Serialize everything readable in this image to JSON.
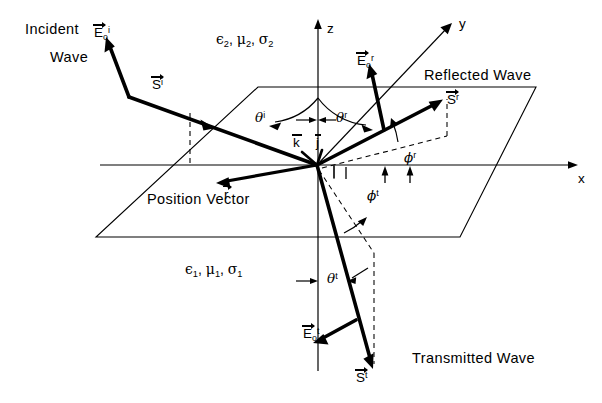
{
  "figure": {
    "background": "#ffffff",
    "stroke": "#000000"
  },
  "labels": {
    "incident_wave_line1": "Incident",
    "incident_wave_line2": "Wave",
    "reflected_wave": "Reflected  Wave",
    "transmitted_wave": "Transmitted  Wave",
    "position_vector": "Position  Vector",
    "medium_upper": {
      "eps": "ϵ",
      "eps_sub": "2",
      "mu": "μ",
      "mu_sub": "2",
      "sigma": "σ",
      "sigma_sub": "2",
      "sep1": ",",
      "sep2": ","
    },
    "medium_lower": {
      "eps": "ϵ",
      "eps_sub": "1",
      "mu": "μ",
      "mu_sub": "1",
      "sigma": "σ",
      "sigma_sub": "1",
      "sep1": ",",
      "sep2": ","
    }
  },
  "axes": {
    "x": "x",
    "y": "y",
    "z": "z"
  },
  "unit_vectors": {
    "k": "k",
    "j": "j"
  },
  "vectors": {
    "E_incident": {
      "base": "E",
      "sub": "o",
      "sup": "i"
    },
    "S_incident": {
      "base": "S",
      "sup": "i"
    },
    "E_reflected": {
      "base": "E",
      "sub": "o",
      "sup": "r"
    },
    "S_reflected": {
      "base": "S",
      "sup": "r"
    },
    "E_transmitted": {
      "base": "E",
      "sub": "o",
      "sup": "t"
    },
    "S_transmitted": {
      "base": "S",
      "sup": "t"
    },
    "r_position": {
      "base": "r"
    }
  },
  "angles": {
    "theta_incident": {
      "sym": "θ",
      "sup": "i"
    },
    "theta_reflected": {
      "sym": "θ",
      "sup": "r"
    },
    "theta_transmitted": {
      "sym": "θ",
      "sup": "t"
    },
    "phi_reflected": {
      "sym": "ϕ",
      "sup": "r"
    },
    "phi_transmitted": {
      "sym": "ϕ",
      "sup": "t"
    }
  },
  "geometry": {
    "origin": {
      "x": 317,
      "y": 165
    },
    "interface_plane_corners": [
      {
        "x": 258,
        "y": 87
      },
      {
        "x": 536,
        "y": 87
      },
      {
        "x": 460,
        "y": 237
      },
      {
        "x": 96,
        "y": 237
      }
    ],
    "x_axis": {
      "x1": 100,
      "y1": 165,
      "x2": 575,
      "y2": 165
    },
    "z_axis": {
      "x1": 318,
      "y1": 370,
      "x2": 318,
      "y2": 20
    },
    "y_axis": {
      "x1": 317,
      "y1": 165,
      "x2": 452,
      "y2": 23
    }
  }
}
